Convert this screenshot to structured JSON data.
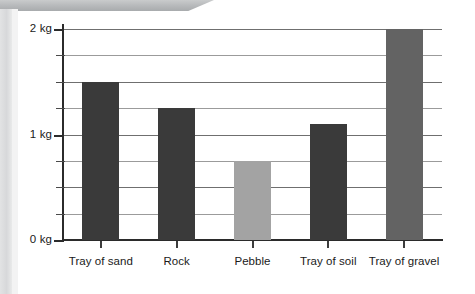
{
  "chart_data": {
    "type": "bar",
    "title": "",
    "xlabel": "",
    "ylabel": "",
    "ylim": [
      0,
      2
    ],
    "y_unit": "kg",
    "grid": true,
    "legend": "none",
    "y_tick_labels": [
      "0 kg",
      "1 kg",
      "2 kg"
    ],
    "y_tick_values": [
      0,
      1,
      2
    ],
    "y_gridline_values": [
      0.25,
      0.5,
      0.75,
      1.0,
      1.25,
      1.5,
      1.75,
      2.0
    ],
    "categories": [
      "Tray of sand",
      "Rock",
      "Pebble",
      "Tray of soil",
      "Tray of gravel"
    ],
    "values": [
      1.5,
      1.25,
      0.75,
      1.1,
      2.0
    ],
    "bar_colors": [
      "#3a3a3a",
      "#3a3a3a",
      "#a3a3a3",
      "#3a3a3a",
      "#636363"
    ]
  },
  "axis": {
    "y_labels": [
      {
        "text": "2 kg",
        "value": 2
      },
      {
        "text": "1 kg",
        "value": 1
      },
      {
        "text": "0 kg",
        "value": 0
      }
    ]
  },
  "colors": {
    "bar_dark": "#3a3a3a",
    "bar_light": "#a3a3a3",
    "bar_medium": "#636363",
    "gridline": "#6f6f6f",
    "axis": "#2b2b2b",
    "text": "#1a1a1a",
    "page_edge": "#d7d8da"
  }
}
